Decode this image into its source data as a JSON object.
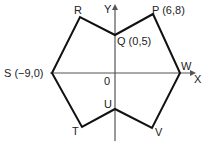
{
  "diagram": {
    "type": "coordinate-geometry-hexagon",
    "axes": {
      "x_label": "X",
      "y_label": "Y",
      "origin_label": "0"
    },
    "points": {
      "P": {
        "label": "P (6,8)"
      },
      "Q": {
        "label": "Q (0,5)"
      },
      "R": {
        "label": "R"
      },
      "S": {
        "label": "S (−9,0)"
      },
      "T": {
        "label": "T"
      },
      "U": {
        "label": "U"
      },
      "V": {
        "label": "V"
      },
      "W": {
        "label": "W"
      }
    },
    "polygon_order": [
      "P",
      "Q",
      "R",
      "S",
      "T",
      "U",
      "V",
      "W"
    ],
    "colors": {
      "line": "#111111",
      "axis": "#555555",
      "background": "#ffffff"
    }
  }
}
